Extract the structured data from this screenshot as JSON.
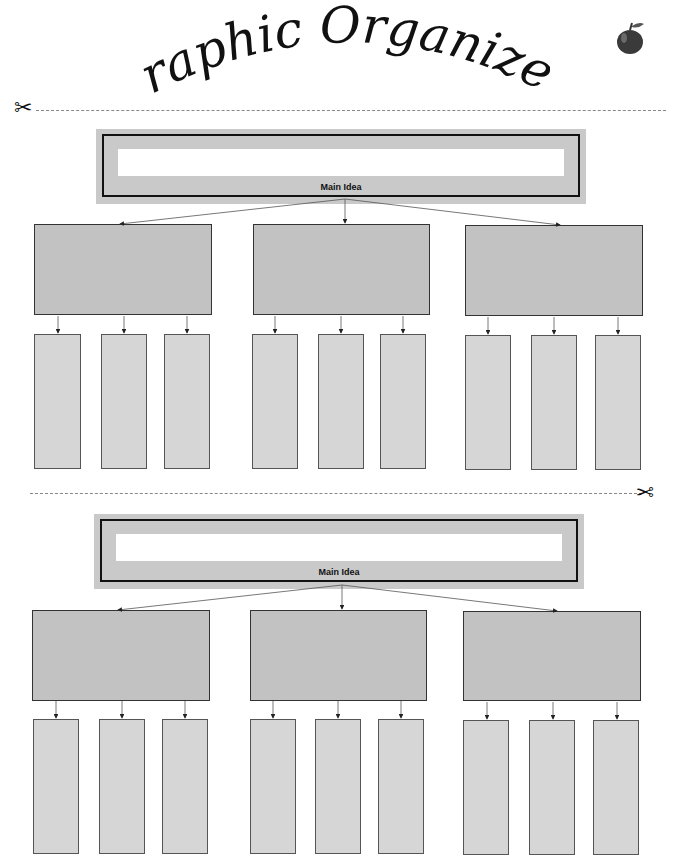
{
  "header": {
    "title": "Graphic Organizer",
    "decoration_icon": "apple-icon"
  },
  "cut_lines": [
    {
      "position": "top",
      "icon": "scissors-icon"
    },
    {
      "position": "middle",
      "icon": "scissors-icon"
    }
  ],
  "organizers": [
    {
      "main_idea": {
        "label": "Main Idea",
        "value": ""
      },
      "details": [
        {
          "value": "",
          "sub_details": [
            "",
            "",
            ""
          ]
        },
        {
          "value": "",
          "sub_details": [
            "",
            "",
            ""
          ]
        },
        {
          "value": "",
          "sub_details": [
            "",
            "",
            ""
          ]
        }
      ]
    },
    {
      "main_idea": {
        "label": "Main Idea",
        "value": ""
      },
      "details": [
        {
          "value": "",
          "sub_details": [
            "",
            "",
            ""
          ]
        },
        {
          "value": "",
          "sub_details": [
            "",
            "",
            ""
          ]
        },
        {
          "value": "",
          "sub_details": [
            "",
            "",
            ""
          ]
        }
      ]
    }
  ],
  "colors": {
    "main_frame": "#c9c9c9",
    "detail_box": "#c2c2c2",
    "sub_box": "#d6d6d6",
    "border": "#111111"
  }
}
